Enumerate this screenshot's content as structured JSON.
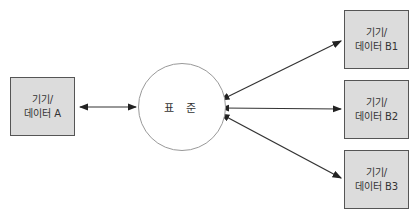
{
  "diagram": {
    "center": {
      "label": "표 준"
    },
    "left": {
      "line1": "기기/",
      "line2": "데이터 A"
    },
    "right": [
      {
        "line1": "기기/",
        "line2": "데이터 B1"
      },
      {
        "line1": "기기/",
        "line2": "데이터 B2"
      },
      {
        "line1": "기기/",
        "line2": "데이터 B3"
      }
    ],
    "colors": {
      "box_fill": "#dcdcdc",
      "box_border": "#555555",
      "circle_border": "#999999",
      "arrow": "#222222"
    }
  }
}
